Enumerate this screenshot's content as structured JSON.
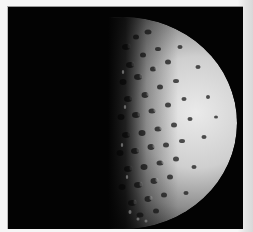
{
  "image": {
    "subject": "Half-illuminated heavily cratered moon against black space",
    "alt": "Cratered moon, lit from the right, terminator near center",
    "colors": {
      "background_space": "#030303",
      "lit_limb": "#e6e6e6",
      "mid_surface": "#9a9a9a",
      "shadow_side": "#1a1a1a",
      "page_border": "#f6f6f6"
    }
  }
}
